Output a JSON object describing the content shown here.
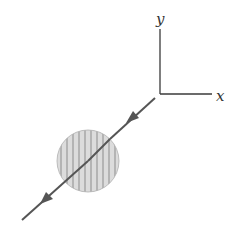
{
  "diagram": {
    "type": "physics-vector-diagram",
    "axes": {
      "x_label": "x",
      "y_label": "y",
      "color": "#3a3a3a"
    },
    "particle": {
      "shape": "circle",
      "fill": "#d9d9d9",
      "stripe_color": "#8a8a8a",
      "pattern": "vertical-stripes"
    },
    "trajectory": {
      "color": "#555555",
      "direction": "down-left",
      "arrow_count": 2
    }
  }
}
